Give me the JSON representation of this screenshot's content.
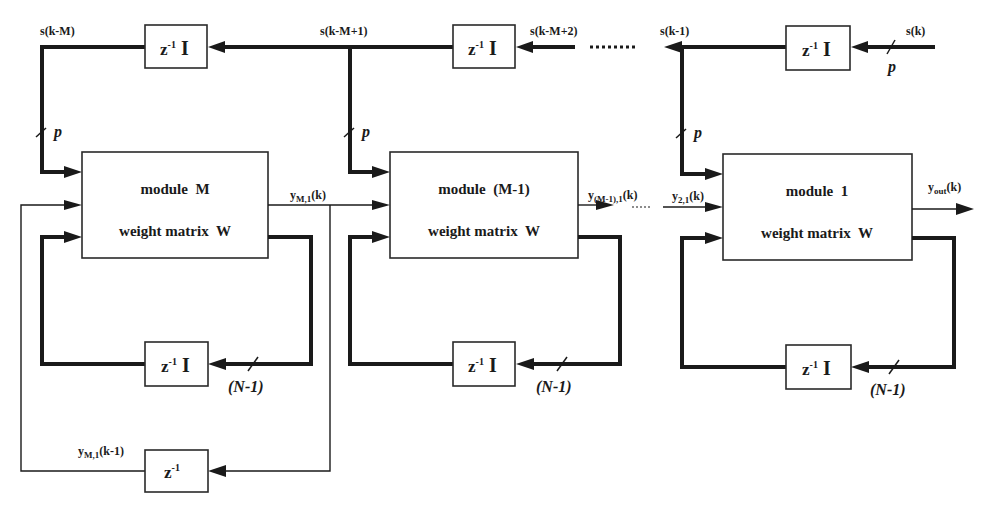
{
  "diagram": {
    "colors": {
      "ink": "#1a1a1a",
      "background": "#ffffff"
    },
    "delays_top": [
      {
        "id": "delay-top-1",
        "label": "z",
        "exp": "-1",
        "mat": "I"
      },
      {
        "id": "delay-top-2",
        "label": "z",
        "exp": "-1",
        "mat": "I"
      },
      {
        "id": "delay-top-3",
        "label": "z",
        "exp": "-1",
        "mat": "I"
      }
    ],
    "signals_top": {
      "s_k_minus_M": "s(k-M)",
      "s_k_minus_M_plus_1": "s(k-M+1)",
      "s_k_minus_M_plus_2": "s(k-M+2)",
      "s_k_minus_1": "s(k-1)",
      "s_k": "s(k)"
    },
    "bus_width_p": "p",
    "bus_width_feedback": "(N-1)",
    "modules": [
      {
        "id": "module-M",
        "title": "module  M",
        "subtitle": "weight matrix  W"
      },
      {
        "id": "module-M-minus-1",
        "title": "module  (M-1)",
        "subtitle": "weight matrix  W"
      },
      {
        "id": "module-1",
        "title": "module  1",
        "subtitle": "weight matrix  W"
      }
    ],
    "outputs": {
      "y_M1": {
        "base": "y",
        "sub": "M,1",
        "arg": "(k)"
      },
      "y_M_minus_1_1": {
        "base": "y",
        "sub": "(M-1),1",
        "arg": "(k)"
      },
      "y_21": {
        "base": "y",
        "sub": "2,1",
        "arg": "(k)"
      },
      "y_out": {
        "base": "y",
        "sub": "out",
        "arg": "(k)"
      },
      "y_M1_delayed": {
        "base": "y",
        "sub": "M,1",
        "arg": "(k-1)"
      }
    },
    "delays_feedback": [
      {
        "id": "delay-fb-M",
        "label": "z",
        "exp": "-1",
        "mat": "I"
      },
      {
        "id": "delay-fb-M-1",
        "label": "z",
        "exp": "-1",
        "mat": "I"
      },
      {
        "id": "delay-fb-1",
        "label": "z",
        "exp": "-1",
        "mat": "I"
      }
    ],
    "delay_outer": {
      "id": "delay-outer",
      "label": "z",
      "exp": "-1"
    }
  }
}
